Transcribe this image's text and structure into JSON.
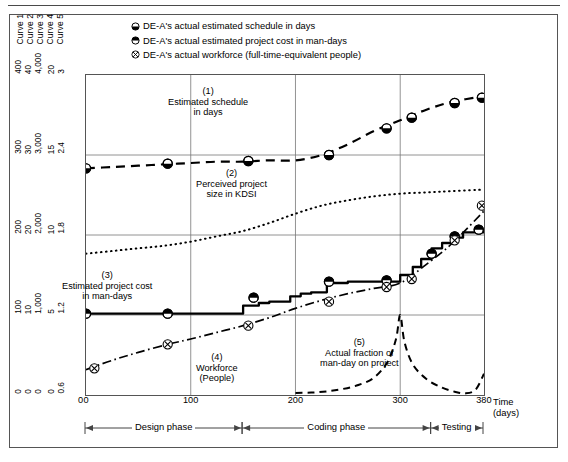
{
  "figure": {
    "curve_axis_titles": [
      "Curve 1",
      "Curve 2",
      "Curve 3",
      "Curve 4",
      "Curve 5"
    ],
    "legend": [
      {
        "marker": "circle-bottom-half-filled",
        "label": "DE-A's actual estimated schedule in days"
      },
      {
        "marker": "circle-top-half-filled",
        "label": "DE-A's actual estimated project cost in man-days"
      },
      {
        "marker": "circle-x",
        "label": "DE-A's actual workforce (full-time-equivalent people)"
      }
    ],
    "time_axis_label_line1": "Time",
    "time_axis_label_line2": "(days)",
    "phases": [
      {
        "name": "Design phase",
        "start": 0,
        "end": 150
      },
      {
        "name": "Coding phase",
        "start": 150,
        "end": 330
      },
      {
        "name": "Testing",
        "start": 330,
        "end": 380
      }
    ]
  },
  "chart_data": {
    "type": "line",
    "title": "",
    "xlabel": "Time (days)",
    "grid": true,
    "legend_position": "top",
    "x_ticks": [
      0,
      100,
      200,
      300,
      380
    ],
    "xlim": [
      0,
      380
    ],
    "y_axes": [
      {
        "name": "Curve 1",
        "ticks": [
          "0",
          "100",
          "200",
          "300",
          "400"
        ],
        "values": [
          0,
          100,
          200,
          300,
          400
        ],
        "ylim": [
          0,
          400
        ]
      },
      {
        "name": "Curve 2",
        "ticks": [
          "0",
          "10",
          "20",
          "30",
          "40"
        ],
        "values": [
          0,
          10,
          20,
          30,
          40
        ],
        "ylim": [
          0,
          40
        ]
      },
      {
        "name": "Curve 3",
        "ticks": [
          "0",
          "1,000",
          "2,000",
          "3,000",
          "4,000"
        ],
        "values": [
          0,
          1000,
          2000,
          3000,
          4000
        ],
        "ylim": [
          0,
          4000
        ]
      },
      {
        "name": "Curve 4",
        "ticks": [
          "0",
          "5",
          "10",
          "15",
          "20"
        ],
        "values": [
          0,
          5,
          10,
          15,
          20
        ],
        "ylim": [
          0,
          20
        ]
      },
      {
        "name": "Curve 5",
        "ticks": [
          "0.6",
          "1.2",
          "1.8",
          "2.4",
          "3"
        ],
        "values": [
          0.6,
          1.2,
          1.8,
          2.4,
          3
        ],
        "ylim": [
          0.6,
          3
        ]
      }
    ],
    "x_axis_origin_label": "0",
    "annotations": [
      {
        "id": "1",
        "text_lines": [
          "(1)",
          "Estimated schedule",
          "in days"
        ]
      },
      {
        "id": "2",
        "text_lines": [
          "(2)",
          "Perceived project",
          "size in KDSI"
        ]
      },
      {
        "id": "3",
        "text_lines": [
          "(3)",
          "Estimated project cost",
          "in man-days"
        ]
      },
      {
        "id": "4",
        "text_lines": [
          "(4)",
          "Workforce",
          "(People)"
        ]
      },
      {
        "id": "5",
        "text_lines": [
          "(5)",
          "Actual fraction of",
          "man-day on project"
        ]
      }
    ],
    "series": [
      {
        "name": "Estimated schedule in days",
        "curve": "1",
        "style": "dashed",
        "marker": "circle-bottom-half-filled",
        "x": [
          0,
          25,
          50,
          75,
          100,
          125,
          150,
          175,
          200,
          225,
          250,
          275,
          300,
          325,
          350,
          380
        ],
        "y": [
          2.3,
          2.31,
          2.32,
          2.33,
          2.34,
          2.35,
          2.35,
          2.36,
          2.36,
          2.4,
          2.48,
          2.58,
          2.66,
          2.74,
          2.8,
          2.84
        ],
        "marker_points": {
          "x": [
            0,
            78,
            155,
            232,
            287,
            311,
            352,
            378
          ],
          "y": [
            2.3,
            2.335,
            2.355,
            2.4,
            2.6,
            2.68,
            2.79,
            2.83
          ]
        }
      },
      {
        "name": "Perceived project size in KDSI",
        "curve": "2",
        "style": "dotted",
        "marker": "none",
        "x": [
          0,
          25,
          50,
          75,
          100,
          125,
          150,
          175,
          200,
          225,
          250,
          275,
          300,
          325,
          350,
          380
        ],
        "y": [
          1.66,
          1.68,
          1.7,
          1.72,
          1.75,
          1.79,
          1.83,
          1.89,
          1.96,
          2.02,
          2.06,
          2.09,
          2.11,
          2.12,
          2.13,
          2.14
        ]
      },
      {
        "name": "Estimated project cost in man-days",
        "curve": "3",
        "style": "solid-stair",
        "marker": "circle-top-half-filled",
        "x": [
          0,
          78,
          140,
          150,
          165,
          175,
          195,
          205,
          215,
          230,
          250,
          270,
          300,
          312,
          320,
          330,
          340,
          350,
          360,
          380
        ],
        "y": [
          1.21,
          1.21,
          1.21,
          1.27,
          1.29,
          1.3,
          1.34,
          1.36,
          1.37,
          1.44,
          1.45,
          1.45,
          1.5,
          1.56,
          1.62,
          1.7,
          1.74,
          1.78,
          1.82,
          1.83
        ],
        "marker_points": {
          "x": [
            0,
            78,
            160,
            232,
            287,
            330,
            352,
            375
          ],
          "y": [
            1.21,
            1.21,
            1.33,
            1.45,
            1.46,
            1.66,
            1.79,
            1.84
          ]
        }
      },
      {
        "name": "Workforce (full-time-equivalent people)",
        "curve": "4",
        "style": "dash-dot",
        "marker": "circle-x",
        "x": [
          0,
          25,
          50,
          78,
          100,
          125,
          150,
          175,
          200,
          225,
          250,
          275,
          300,
          325,
          350,
          380
        ],
        "y": [
          0.79,
          0.86,
          0.92,
          0.98,
          1.02,
          1.07,
          1.12,
          1.18,
          1.25,
          1.31,
          1.36,
          1.4,
          1.44,
          1.58,
          1.74,
          1.98
        ],
        "marker_points": {
          "x": [
            8,
            78,
            155,
            232,
            287,
            311,
            352,
            378
          ],
          "y": [
            0.8,
            0.98,
            1.12,
            1.3,
            1.41,
            1.47,
            1.76,
            2.02
          ]
        }
      },
      {
        "name": "Actual fraction of man-day on project",
        "curve": "5",
        "style": "dashed-thin",
        "marker": "none",
        "x": [
          200,
          215,
          230,
          245,
          260,
          275,
          288,
          296,
          300,
          304,
          312,
          325,
          340,
          352,
          362,
          372,
          380
        ],
        "y": [
          0.615,
          0.618,
          0.627,
          0.645,
          0.675,
          0.73,
          0.85,
          1.02,
          1.2,
          1.0,
          0.83,
          0.72,
          0.655,
          0.625,
          0.612,
          0.64,
          0.76
        ]
      }
    ]
  }
}
